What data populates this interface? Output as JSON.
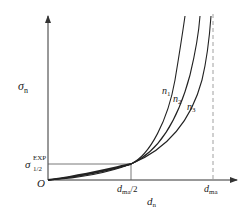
{
  "diagram": {
    "type": "curve-plot",
    "y_axis_label": "σ",
    "y_axis_label_sub": "n",
    "x_axis_label": "d",
    "x_axis_label_sub": "n",
    "origin_label": "O",
    "y_marker_label": "σ",
    "y_marker_sup": "EXP",
    "y_marker_sub": "1/2",
    "x_marker_half_label": "d",
    "x_marker_half_sub": "ma",
    "x_marker_half_suffix": "/2",
    "x_marker_full_label": "d",
    "x_marker_full_sub": "ma",
    "curves": [
      {
        "name": "n",
        "sub": "1"
      },
      {
        "name": "n",
        "sub": "2"
      },
      {
        "name": "n",
        "sub": "3"
      }
    ],
    "colors": {
      "axis": "#333333",
      "curve": "#222222",
      "guide": "#555555",
      "dashed": "#888888"
    }
  }
}
